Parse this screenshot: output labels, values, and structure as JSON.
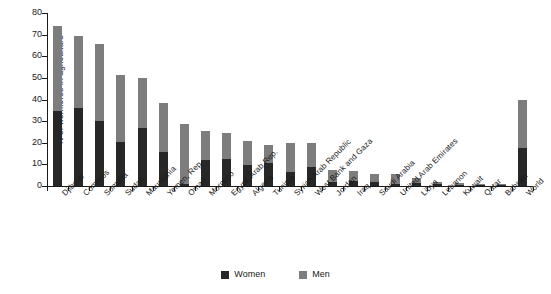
{
  "chart_data": {
    "type": "bar",
    "stacked": true,
    "title": "",
    "xlabel": "",
    "ylabel": "% of workforce in agriculture",
    "ylim": [
      0,
      80
    ],
    "yticks": [
      0,
      10,
      20,
      30,
      40,
      50,
      60,
      70,
      80
    ],
    "grid": false,
    "legend_position": "bottom-center",
    "categories": [
      "Djibouti",
      "Comoros",
      "Somalia",
      "Sudan",
      "Mauritania",
      "Yemen, Rep.",
      "Oman",
      "Morocco",
      "Egypt, Arab Rep.",
      "Algeria",
      "Tunisia",
      "Syrian Arab Republic",
      "West Bank and Gaza",
      "Jordan",
      "Iraq",
      "Saudi Arabia",
      "United Arab Emirates",
      "Libya",
      "Lebanon",
      "Kuwait",
      "Qatar",
      "Bahrain",
      "World"
    ],
    "series": [
      {
        "name": "Women",
        "color": "#272727",
        "values": [
          34.5,
          36.0,
          30.0,
          20.5,
          27.0,
          15.5,
          1.0,
          12.0,
          12.5,
          9.5,
          10.5,
          6.5,
          9.0,
          2.0,
          2.5,
          2.0,
          1.0,
          1.5,
          1.0,
          0.5,
          0.4,
          0.3,
          17.5
        ]
      },
      {
        "name": "Men",
        "color": "#7d7d7d",
        "values": [
          39.5,
          33.5,
          35.5,
          31.0,
          23.0,
          23.0,
          27.5,
          13.5,
          12.0,
          11.5,
          8.5,
          13.5,
          11.0,
          5.5,
          4.5,
          3.5,
          4.5,
          2.0,
          1.0,
          1.0,
          0.6,
          0.4,
          22.5
        ]
      }
    ],
    "totals": [
      74.0,
      69.5,
      65.5,
      51.5,
      50.0,
      38.5,
      28.5,
      25.5,
      24.5,
      21.0,
      19.0,
      20.0,
      20.0,
      7.5,
      7.0,
      5.5,
      5.5,
      3.5,
      2.0,
      1.5,
      1.0,
      0.7,
      40.0
    ]
  },
  "legend": {
    "items": [
      {
        "label": "Women",
        "color": "#272727"
      },
      {
        "label": "Men",
        "color": "#7d7d7d"
      }
    ]
  },
  "axis": {
    "y_title": "% of workforce in agriculture"
  }
}
